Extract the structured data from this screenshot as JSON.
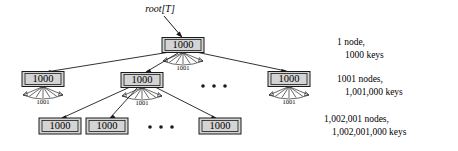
{
  "figure": {
    "type": "b-tree-diagram",
    "root_pointer_label": "root[T]",
    "node_key_count_label": "1000",
    "fan_label": "1001",
    "ellipsis": "• • •"
  },
  "levels": [
    {
      "depth": 0,
      "nodes": [
        {
          "keys_label": "1000",
          "children_label": "1001"
        }
      ],
      "legend": {
        "line1": "1 node,",
        "line2": "1000 keys"
      }
    },
    {
      "depth": 1,
      "nodes": [
        {
          "keys_label": "1000",
          "children_label": "1001"
        },
        {
          "keys_label": "1000",
          "children_label": "1001"
        },
        {
          "keys_label": "1000",
          "children_label": "1001"
        }
      ],
      "legend": {
        "line1": "1001 nodes,",
        "line2": "1,001,000 keys"
      }
    },
    {
      "depth": 2,
      "nodes": [
        {
          "keys_label": "1000"
        },
        {
          "keys_label": "1000"
        },
        {
          "keys_label": "1000"
        },
        {
          "keys_label": "1000"
        }
      ],
      "legend": {
        "line1": "1,002,001 nodes,",
        "line2": "1,002,001,000 keys"
      }
    }
  ],
  "colors": {
    "node_fill": "#d4d4d4",
    "node_stroke": "#1a1a1a",
    "text": "#000000",
    "background": "#ffffff"
  }
}
